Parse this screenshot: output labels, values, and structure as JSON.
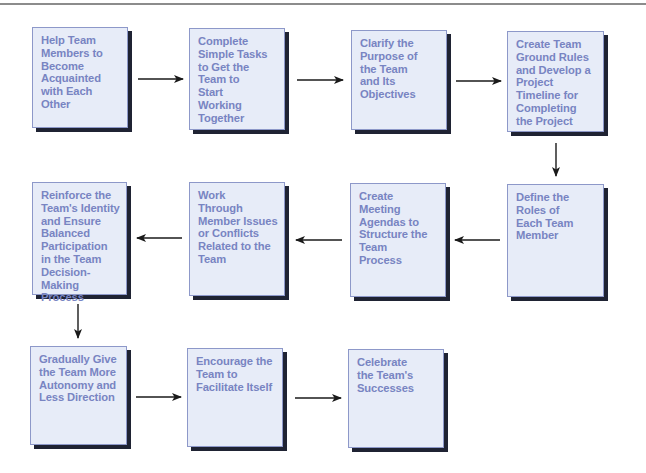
{
  "diagram": {
    "type": "process-flow",
    "colors": {
      "box_fill": "#e7ecf8",
      "box_border": "#8d98c9",
      "box_shadow": "#1f2333",
      "text": "#7884c2",
      "arrow": "#1a1a1a",
      "top_rule": "#8c8c8c"
    },
    "steps": [
      {
        "id": 1,
        "label": "Help Team\nMembers to\nBecome\nAcquainted\nwith Each\nOther"
      },
      {
        "id": 2,
        "label": "Complete\nSimple Tasks\nto Get the\nTeam to\nStart\nWorking\nTogether"
      },
      {
        "id": 3,
        "label": "Clarify the\nPurpose of\nthe Team\nand Its\nObjectives"
      },
      {
        "id": 4,
        "label": "Create Team\nGround Rules\nand Develop a\nProject\nTimeline for\nCompleting\nthe Project"
      },
      {
        "id": 5,
        "label": "Define the\nRoles of\nEach Team\nMember"
      },
      {
        "id": 6,
        "label": "Create\nMeeting\nAgendas to\nStructure the\nTeam\nProcess"
      },
      {
        "id": 7,
        "label": "Work\nThrough\nMember Issues\nor Conflicts\nRelated to the\nTeam"
      },
      {
        "id": 8,
        "label": "Reinforce the\nTeam's Identity\nand Ensure\nBalanced\nParticipation\nin the Team\nDecision-Making\nProcess"
      },
      {
        "id": 9,
        "label": "Gradually Give\nthe Team More\nAutonomy and\nLess Direction"
      },
      {
        "id": 10,
        "label": "Encourage the\nTeam to\nFacilitate Itself"
      },
      {
        "id": 11,
        "label": "Celebrate\nthe Team's\nSuccesses"
      }
    ],
    "connections": [
      {
        "from": 1,
        "to": 2,
        "direction": "right"
      },
      {
        "from": 2,
        "to": 3,
        "direction": "right"
      },
      {
        "from": 3,
        "to": 4,
        "direction": "right"
      },
      {
        "from": 4,
        "to": 5,
        "direction": "down"
      },
      {
        "from": 5,
        "to": 6,
        "direction": "left"
      },
      {
        "from": 6,
        "to": 7,
        "direction": "left"
      },
      {
        "from": 7,
        "to": 8,
        "direction": "left"
      },
      {
        "from": 8,
        "to": 9,
        "direction": "down"
      },
      {
        "from": 9,
        "to": 10,
        "direction": "right"
      },
      {
        "from": 10,
        "to": 11,
        "direction": "right"
      }
    ]
  }
}
